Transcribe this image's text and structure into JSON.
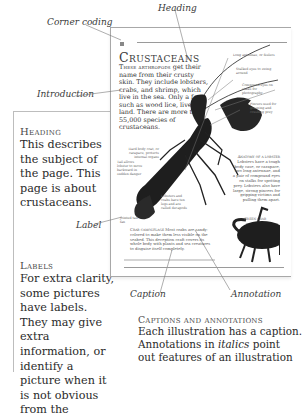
{
  "callouts": {
    "heading": "Heading",
    "corner_coding": "Corner coding",
    "introduction": "Introduction",
    "label": "Label",
    "caption": "Caption",
    "annotation": "Annotation"
  },
  "left_panel": {
    "heading_section": {
      "title": "Heading",
      "body": "This describes the subject of the page. This page is about crustaceans."
    },
    "labels_section": {
      "title": "Labels",
      "body": "For extra clarity, some pictures have labels. They may give extra information, or identify a picture when it is not obvious from the"
    }
  },
  "sample_page": {
    "title": "Crustaceans",
    "intro_lead": "These arthropods",
    "intro_rest": " get their name from their crusty skin. They include lobsters, crabs, and shrimp, which live in the sea. Only a few, such as wood lice, live on land. There are more than 55,000 species of crustaceans.",
    "annotations": [
      "Long antennae, or feelers",
      "Stalked eyes to swing around",
      "Compound eyes on stalks for photography",
      "Pincers used for grasping and crushing prey",
      "Hard body coat, or carapace, protects internal organs",
      "Tail allows lobster to move backward in sudden danger",
      "Lobsters and crabs have ten legs and are called decapods",
      "Jointed tail fan"
    ],
    "caption_title": "Anatomy of a lobster",
    "caption_body": "Lobsters have a tough body case, or carapace, two long antennae, and a pair of compound eyes on stalks for spotting prey. Lobsters also have large, strong pincers for gripping victims and pulling them apart.",
    "crab_label": "Green crab",
    "camouflage_title": "Crab camouflage",
    "camouflage_body": "Most crabs are sandy-colored to make them less visible on the seabed. This deception craft covers its whole body with plants and sea creatures to disguise itself completely."
  },
  "bottom_section": {
    "title": "Captions and annotations",
    "lines": [
      "Each illustration has a caption.",
      "Annotations in italics point",
      "out features of an illustration"
    ],
    "italic_word": "italics"
  },
  "colors": {
    "text": "#2a2a2a",
    "rule": "#9a9a9a",
    "illustration": "#1e1e1e"
  }
}
